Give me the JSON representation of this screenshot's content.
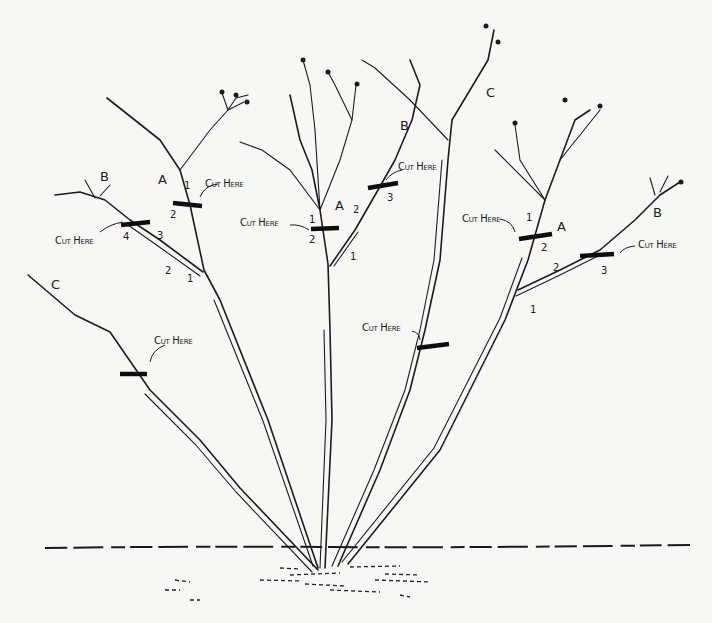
{
  "diagram": {
    "cut_label": "Cut Here",
    "cane_labels": {
      "A": "A",
      "B": "B",
      "C": "C"
    },
    "bud_numbers": [
      "1",
      "2",
      "3",
      "4"
    ],
    "cuts": [
      {
        "id": "left-A",
        "cane": "A",
        "label": "Cut Here",
        "bud_numbers": [
          "1",
          "2"
        ]
      },
      {
        "id": "left-B",
        "cane": "B",
        "label": "Cut Here",
        "bud_numbers": [
          "1",
          "2",
          "3",
          "4"
        ]
      },
      {
        "id": "left-C",
        "cane": "C",
        "label": "Cut Here",
        "bud_numbers": []
      },
      {
        "id": "center-A",
        "cane": "A",
        "label": "Cut Here",
        "bud_numbers": [
          "1",
          "2"
        ]
      },
      {
        "id": "center-B",
        "cane": "B",
        "label": "Cut Here",
        "bud_numbers": [
          "1",
          "2",
          "3"
        ]
      },
      {
        "id": "center-C",
        "cane": "C",
        "label": "Cut Here",
        "bud_numbers": []
      },
      {
        "id": "right-A",
        "cane": "A",
        "label": "Cut Here",
        "bud_numbers": [
          "1",
          "2"
        ]
      },
      {
        "id": "right-B",
        "cane": "B",
        "label": "Cut Here",
        "bud_numbers": [
          "1",
          "2",
          "3"
        ]
      }
    ],
    "colors": {
      "ink": "#1c1c1c",
      "paper": "#f7f7f5"
    }
  }
}
